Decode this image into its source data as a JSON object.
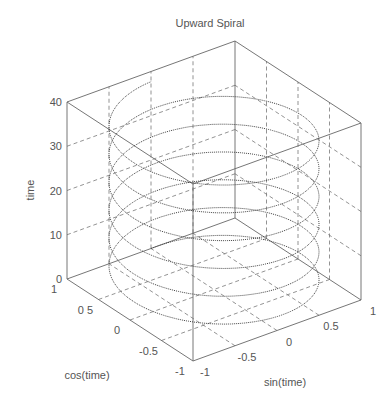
{
  "header": {
    "cut_off_text": "Upward Spiral"
  },
  "chart_data": {
    "type": "line3d",
    "title": "Upward Spiral",
    "xlabel": "sin(time)",
    "ylabel": "cos(time)",
    "zlabel": "time",
    "x_ticks": [
      "-1",
      "-0.5",
      "0",
      "0.5",
      "1"
    ],
    "y_ticks": [
      "-1",
      "-0.5",
      "0",
      "0.5",
      "1"
    ],
    "z_ticks": [
      "0",
      "10",
      "20",
      "30",
      "40"
    ],
    "x_tick_labels_display": [
      "-1",
      "-0.5",
      "0",
      "0.5",
      "1"
    ],
    "y_tick_labels_display": [
      "-1",
      "-0.5",
      "0",
      "0 5",
      "1"
    ],
    "xlim": [
      -1,
      1
    ],
    "ylim": [
      -1,
      1
    ],
    "zlim": [
      0,
      40
    ],
    "grid": true,
    "line_style": "dotted",
    "series": [
      {
        "name": "helix",
        "x_expr": "sin(time)",
        "y_expr": "cos(time)",
        "z_expr": "time",
        "time_range": [
          0,
          37.7
        ],
        "turns": 6
      }
    ],
    "colors": {
      "axes": "#666666",
      "grid": "#777777",
      "line": "#444444"
    }
  }
}
